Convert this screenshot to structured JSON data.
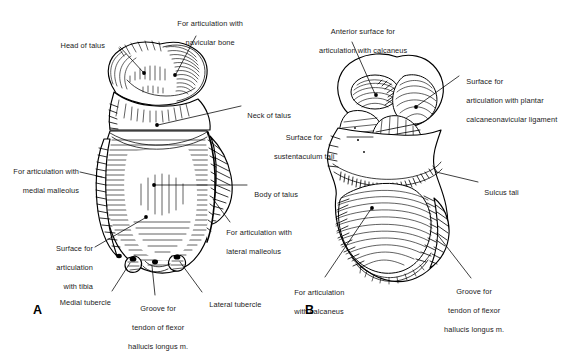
{
  "figure": {
    "background_color": "#ffffff",
    "ink_color": "#000000",
    "style": "black-and-white anatomical line drawing with hatching"
  },
  "panels": [
    {
      "letter": "A",
      "name": "superior-view",
      "description": "Superior (dorsal) view of the right talus"
    },
    {
      "letter": "B",
      "name": "inferior-view",
      "description": "Inferior (plantar) view of the right talus"
    }
  ],
  "labels_panel_a": [
    {
      "id": "head-of-talus",
      "text": "Head of talus"
    },
    {
      "id": "articulation-navicular",
      "line1": "For articulation with",
      "line2": "navicular bone"
    },
    {
      "id": "neck-of-talus",
      "text": "Neck of talus"
    },
    {
      "id": "articulation-medial-malleolus",
      "line1": "For articulation with",
      "line2": "medial malleolus"
    },
    {
      "id": "body-of-talus",
      "text": "Body of talus"
    },
    {
      "id": "articulation-lateral-malleolus",
      "line1": "For articulation with",
      "line2": "lateral malleolus"
    },
    {
      "id": "surface-articulation-tibia",
      "line1": "Surface for",
      "line2": "articulation",
      "line3": "with tibia"
    },
    {
      "id": "medial-tubercle",
      "text": "Medial tubercle"
    },
    {
      "id": "groove-flexor-hallucis-a",
      "line1": "Groove for",
      "line2": "tendon of flexor",
      "line3": "hallucis longus m."
    },
    {
      "id": "lateral-tubercle",
      "text": "Lateral tubercle"
    }
  ],
  "labels_panel_b": [
    {
      "id": "anterior-surface-calcaneus",
      "line1": "Anterior surface for",
      "line2": "articulation with calcaneus"
    },
    {
      "id": "surface-plantar-calcaneonavicular",
      "line1": "Surface for",
      "line2": "articulation with plantar",
      "line3": "calcaneonavicular ligament"
    },
    {
      "id": "surface-sustentaculum-tali",
      "line1": "Surface for",
      "line2": "sustentaculum tali"
    },
    {
      "id": "sulcus-tali",
      "text": "Sulcus tali"
    },
    {
      "id": "articulation-calcaneus",
      "line1": "For articulation",
      "line2": "with calcaneus"
    },
    {
      "id": "groove-flexor-hallucis-b",
      "line1": "Groove for",
      "line2": "tendon of flexor",
      "line3": "hallucis longus m."
    }
  ]
}
